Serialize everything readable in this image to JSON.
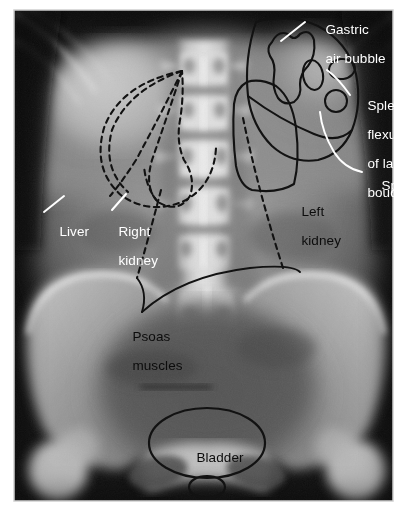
{
  "figure": {
    "kind": "radiograph",
    "view": "anteroposterior-abdomen",
    "modality_note": "plain abdominal x-ray with hand-drawn anatomical overlays",
    "background_color": "#ffffff",
    "film_border_color": "#d8d8d8"
  },
  "labels": [
    {
      "id": "gastric-air-bubble",
      "text_line1": "Gastric",
      "text_line2": "air bubble",
      "color": "#ffffff",
      "x": 310,
      "y": 13,
      "align": "left",
      "leader": "white-straight",
      "points_to": "stomach gas shadow in left upper quadrant"
    },
    {
      "id": "splenic-flexure",
      "text_line1": "Splenic",
      "text_line2": "flexure",
      "text_line3": "of large",
      "text_line4": "boude",
      "color": "#ffffff",
      "x": 353,
      "y": 88,
      "align": "left",
      "leader": "white-curve",
      "points_to": "gas-filled colonic loops at splenic flexure"
    },
    {
      "id": "spleen",
      "text_line1": "Spleen",
      "color": "#ffffff",
      "x": 365,
      "y": 169,
      "align": "left",
      "leader": "white-curve",
      "points_to": "splenic outline left upper quadrant"
    },
    {
      "id": "liver",
      "text_line1": "Liver",
      "color": "#ffffff",
      "x": 46,
      "y": 214,
      "align": "left",
      "leader": "white-straight",
      "points_to": "hepatic margin right upper quadrant"
    },
    {
      "id": "right-kidney",
      "text_line1": "Right",
      "text_line2": "kidney",
      "color": "#ffffff",
      "x": 103,
      "y": 214,
      "align": "left",
      "leader": "white-straight",
      "points_to": "right renal outline"
    },
    {
      "id": "left-kidney",
      "text_line1": "Left",
      "text_line2": "kidney",
      "color": "#111111",
      "x": 285,
      "y": 195,
      "align": "left",
      "leader": "none",
      "points_to": "left renal outline"
    },
    {
      "id": "psoas-muscles",
      "text_line1": "Psoas",
      "text_line2": "muscles",
      "color": "#111111",
      "x": 117,
      "y": 320,
      "align": "left",
      "leader": "black-curve-pair",
      "points_to": "psoas shadow margins both sides"
    },
    {
      "id": "bladder",
      "text_line1": "Bladder",
      "color": "#111111",
      "x": 180,
      "y": 440,
      "align": "left",
      "leader": "none",
      "points_to": "urinary bladder in pelvis"
    }
  ],
  "overlays": [
    {
      "id": "liver-outline",
      "style": "dashed",
      "color": "#111111"
    },
    {
      "id": "right-kidney-outline",
      "style": "dashed",
      "color": "#111111"
    },
    {
      "id": "right-psoas-line",
      "style": "dashed",
      "color": "#111111"
    },
    {
      "id": "left-psoas-line",
      "style": "dashed",
      "color": "#111111"
    },
    {
      "id": "spleen-outline",
      "style": "solid",
      "color": "#111111"
    },
    {
      "id": "gastric-bubble-outline",
      "style": "solid",
      "color": "#111111"
    },
    {
      "id": "colon-gas-oval-1",
      "style": "solid",
      "color": "#111111"
    },
    {
      "id": "colon-gas-oval-2",
      "style": "solid",
      "color": "#111111"
    },
    {
      "id": "colon-gas-oval-3",
      "style": "solid",
      "color": "#111111"
    },
    {
      "id": "left-kidney-outline",
      "style": "solid",
      "color": "#111111"
    },
    {
      "id": "bladder-outline",
      "style": "solid",
      "color": "#111111"
    },
    {
      "id": "bladder-neck-outline",
      "style": "solid",
      "color": "#111111"
    }
  ],
  "anatomy": {
    "spine_label": "lumbar vertebral column",
    "vertebra_count": 5,
    "pelvis_label": "bony pelvis with iliac wings",
    "sacrum_label": "sacrum",
    "ribs_label": "lower rib shadows"
  },
  "palette": {
    "film_dark": "#0e0e0e",
    "soft_tissue_mid": "#6f6f6f",
    "soft_tissue_light": "#9b9b9b",
    "bone_bright": "#e4e4e4",
    "bone_white": "#f2f2f2",
    "gas_dark": "#3a3a3a",
    "overlay_black": "#111111",
    "overlay_white": "#ffffff"
  }
}
